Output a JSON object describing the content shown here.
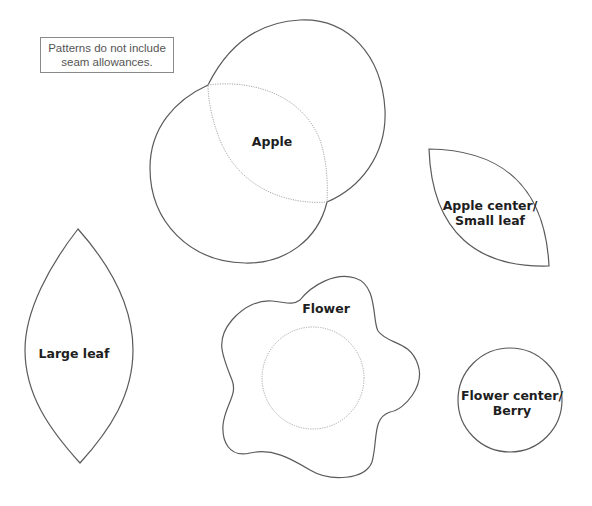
{
  "note": {
    "line1": "Patterns do not include",
    "line2": "seam allowances."
  },
  "pieces": {
    "apple": {
      "label": "Apple"
    },
    "small_leaf": {
      "label_line1": "Apple center/",
      "label_line2": "Small leaf"
    },
    "large_leaf": {
      "label": "Large leaf"
    },
    "flower": {
      "label": "Flower"
    },
    "berry": {
      "label_line1": "Flower center/",
      "label_line2": "Berry"
    }
  },
  "colors": {
    "outline": "#5a5a5a",
    "dotted_guide": "#a8a8a8",
    "text": "#1e1e1e",
    "background": "#ffffff"
  }
}
